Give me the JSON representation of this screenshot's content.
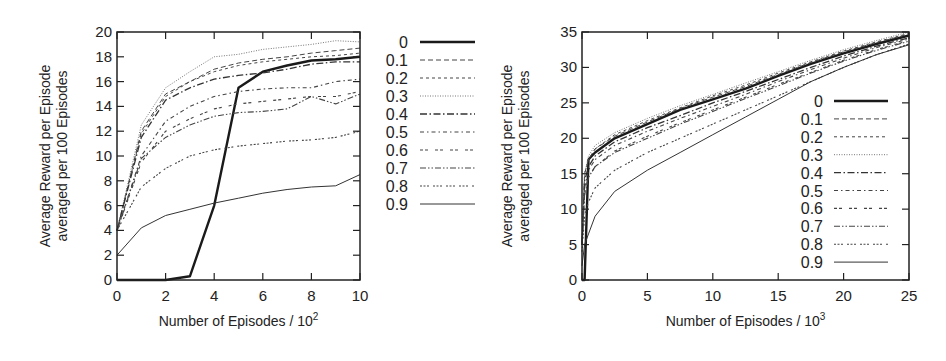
{
  "chart_data": [
    {
      "type": "line",
      "title": "",
      "xlabel": "Number of Episodes / 10^2",
      "ylabel": "Average Reward per Episode averaged per 100 Episodes",
      "ylabel_lines": [
        "Average Reward per Episode",
        "averaged per 100 Episodes"
      ],
      "xlabel_main": "Number of Episodes / 10",
      "xlabel_exp": "2",
      "xlim": [
        0,
        10
      ],
      "ylim": [
        0,
        20
      ],
      "xticks": [
        0,
        2,
        4,
        6,
        8,
        10
      ],
      "yticks": [
        0,
        2,
        4,
        6,
        8,
        10,
        12,
        14,
        16,
        18,
        20
      ],
      "grid": false,
      "legend_position": "outside-right",
      "x": [
        0,
        1,
        2,
        3,
        4,
        5,
        6,
        7,
        8,
        9,
        10
      ],
      "series": [
        {
          "name": "0",
          "style": "solid-thick",
          "values": [
            0,
            0,
            0,
            0.3,
            6,
            15.5,
            16.8,
            17.3,
            17.7,
            17.8,
            18
          ]
        },
        {
          "name": "0.1",
          "style": "dash",
          "values": [
            4,
            12,
            15,
            16,
            17,
            17.5,
            17.8,
            18,
            18.3,
            18.5,
            18.7
          ]
        },
        {
          "name": "0.2",
          "style": "short-dash",
          "values": [
            4,
            11.8,
            14.8,
            16,
            16.8,
            17.3,
            17.6,
            17.8,
            18,
            18.1,
            18.3
          ]
        },
        {
          "name": "0.3",
          "style": "dot",
          "values": [
            4,
            12.5,
            15.5,
            16.8,
            18,
            18.2,
            18.6,
            18.8,
            19,
            19.3,
            19.2
          ]
        },
        {
          "name": "0.4",
          "style": "dash-dot",
          "values": [
            4,
            11.5,
            14.5,
            15.5,
            16.2,
            16.5,
            16.7,
            17,
            17.4,
            17.6,
            17.6
          ]
        },
        {
          "name": "0.5",
          "style": "dash-dot-sparse",
          "values": [
            4,
            10,
            12.8,
            14,
            14.8,
            15.2,
            15.4,
            15.5,
            15.5,
            16,
            16.2
          ]
        },
        {
          "name": "0.6",
          "style": "double-dash",
          "values": [
            4,
            9.5,
            12,
            13,
            13.8,
            14.2,
            14.4,
            14.6,
            14.8,
            14.8,
            15.2
          ]
        },
        {
          "name": "0.7",
          "style": "dash-dot-dot",
          "values": [
            4,
            9.8,
            11.5,
            12.5,
            13.2,
            13.5,
            13.6,
            13.8,
            14.8,
            14.2,
            15
          ]
        },
        {
          "name": "0.8",
          "style": "dot-group",
          "values": [
            4,
            7.5,
            9,
            10,
            10.5,
            10.8,
            11,
            11.2,
            11.3,
            11.5,
            12
          ]
        },
        {
          "name": "0.9",
          "style": "solid-thin",
          "values": [
            2,
            4.2,
            5.2,
            5.7,
            6.2,
            6.6,
            7,
            7.3,
            7.5,
            7.6,
            8.5
          ]
        }
      ]
    },
    {
      "type": "line",
      "title": "",
      "xlabel": "Number of Episodes / 10^3",
      "ylabel": "Average Reward per Episode averaged per 100 Episodes",
      "ylabel_lines": [
        "Average Reward per Episode",
        "averaged per 100 Episodes"
      ],
      "xlabel_main": "Number of Episodes / 10",
      "xlabel_exp": "3",
      "xlim": [
        0,
        25
      ],
      "ylim": [
        0,
        35
      ],
      "xticks": [
        0,
        5,
        10,
        15,
        20,
        25
      ],
      "yticks": [
        0,
        5,
        10,
        15,
        20,
        25,
        30,
        35
      ],
      "grid": false,
      "legend_position": "inside-right",
      "x": [
        0,
        0.2,
        0.5,
        1,
        2.5,
        5,
        7.5,
        10,
        12.5,
        15,
        17.5,
        20,
        22.5,
        25
      ],
      "series": [
        {
          "name": "0",
          "style": "solid-thick",
          "values": [
            0,
            0,
            17,
            18,
            20,
            22,
            24,
            25.5,
            27,
            28.8,
            30.5,
            32,
            33.3,
            34.5
          ]
        },
        {
          "name": "0.1",
          "style": "dash",
          "values": [
            5,
            15,
            17,
            18.5,
            20.3,
            22.3,
            24.2,
            25.8,
            27.3,
            29,
            30.7,
            32.2,
            33.5,
            34.7
          ]
        },
        {
          "name": "0.2",
          "style": "short-dash",
          "values": [
            5,
            15,
            17,
            18.5,
            20.5,
            22.5,
            24.3,
            26,
            27.5,
            29.2,
            30.8,
            32.3,
            33.6,
            34.8
          ]
        },
        {
          "name": "0.3",
          "style": "dot",
          "values": [
            5,
            15,
            17.5,
            19,
            20.8,
            22.8,
            24.6,
            26.2,
            27.8,
            29.4,
            31,
            32.5,
            33.8,
            35
          ]
        },
        {
          "name": "0.4",
          "style": "dash-dot",
          "values": [
            5,
            14,
            16,
            17.5,
            19.5,
            21.5,
            23.2,
            25,
            26.6,
            28.3,
            30,
            31.6,
            33,
            34.2
          ]
        },
        {
          "name": "0.5",
          "style": "dash-dot-sparse",
          "values": [
            5,
            13,
            15.5,
            17,
            19,
            21,
            22.8,
            24.5,
            26.2,
            28,
            29.7,
            31.3,
            32.8,
            34
          ]
        },
        {
          "name": "0.6",
          "style": "double-dash",
          "values": [
            5,
            12,
            14.5,
            16,
            18.2,
            20.3,
            22.2,
            24,
            25.8,
            27.6,
            29.3,
            31,
            32.5,
            33.8
          ]
        },
        {
          "name": "0.7",
          "style": "dash-dot-dot",
          "values": [
            5,
            12,
            14.5,
            16,
            18,
            20,
            22,
            23.8,
            25.6,
            27.4,
            29.2,
            30.9,
            32.4,
            33.7
          ]
        },
        {
          "name": "0.8",
          "style": "dot-group",
          "values": [
            4,
            9,
            11,
            13,
            15.5,
            18,
            20,
            22,
            24,
            26,
            28,
            30,
            31.8,
            33.3
          ]
        },
        {
          "name": "0.9",
          "style": "solid-thin",
          "values": [
            2,
            5,
            6.5,
            9,
            12.5,
            15.5,
            18,
            20.5,
            23,
            25.5,
            28,
            30,
            31.8,
            33.2
          ]
        }
      ]
    }
  ],
  "legend_labels": [
    "0",
    "0.1",
    "0.2",
    "0.3",
    "0.4",
    "0.5",
    "0.6",
    "0.7",
    "0.8",
    "0.9"
  ],
  "colors": {
    "axis": "#222222",
    "line": "#333333",
    "background": "#ffffff"
  }
}
